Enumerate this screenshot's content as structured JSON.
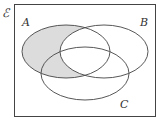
{
  "diagram": {
    "type": "venn",
    "universal_set_label": "ℰ",
    "sets": [
      {
        "label": "A",
        "cx": 66,
        "cy": 51.5,
        "rx": 44,
        "ry": 26.5
      },
      {
        "label": "B",
        "cx": 104,
        "cy": 51.5,
        "rx": 44,
        "ry": 26.5
      },
      {
        "label": "C",
        "cx": 85,
        "cy": 73.5,
        "rx": 44,
        "ry": 26.5
      }
    ],
    "shaded_region": "A only (A ∩ B' ∩ C') plus A ∩ C ∩ B'",
    "colors": {
      "shade": "#dcdcdc",
      "stroke": "#444444",
      "background": "#ffffff"
    }
  }
}
